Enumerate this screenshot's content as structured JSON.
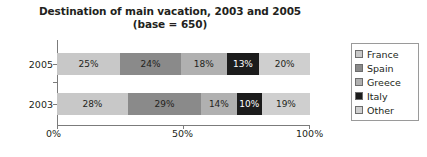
{
  "chart_data": {
    "type": "bar",
    "orientation": "horizontal",
    "stacked": true,
    "normalized_percent": true,
    "title": "Destination of main vacation, 2003 and 2005",
    "subtitle": "(base = 650)",
    "xlabel": "",
    "ylabel": "",
    "categories": [
      "2005",
      "2003"
    ],
    "xticks": [
      "0%",
      "50%",
      "100%"
    ],
    "xlim": [
      0,
      100
    ],
    "grid": false,
    "legend_position": "right",
    "series": [
      {
        "name": "France",
        "color": "#c8c8c8",
        "values": [
          25,
          28
        ],
        "labels": [
          "25%",
          "28%"
        ]
      },
      {
        "name": "Spain",
        "color": "#8a8a8a",
        "values": [
          24,
          29
        ],
        "labels": [
          "24%",
          "29%"
        ]
      },
      {
        "name": "Greece",
        "color": "#b0b0b0",
        "values": [
          18,
          14
        ],
        "labels": [
          "18%",
          "14%"
        ]
      },
      {
        "name": "Italy",
        "color": "#1c1c1c",
        "values": [
          13,
          10
        ],
        "labels": [
          "13%",
          "10%"
        ]
      },
      {
        "name": "Other",
        "color": "#cfcfcf",
        "values": [
          20,
          19
        ],
        "labels": [
          "20%",
          "19%"
        ]
      }
    ]
  },
  "legend": {
    "items": [
      {
        "label": "France",
        "color": "#c8c8c8"
      },
      {
        "label": "Spain",
        "color": "#8a8a8a"
      },
      {
        "label": "Greece",
        "color": "#b0b0b0"
      },
      {
        "label": "Italy",
        "color": "#1c1c1c"
      },
      {
        "label": "Other",
        "color": "#cfcfcf"
      }
    ]
  },
  "axis": {
    "x_tick_labels": [
      "0%",
      "50%",
      "100%"
    ],
    "y_tick_labels": [
      "2005",
      "2003"
    ]
  }
}
